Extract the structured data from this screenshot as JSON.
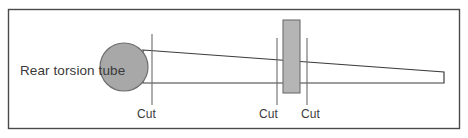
{
  "diagram": {
    "title_label": "Rear torsion tube",
    "frame": {
      "x": 8.5,
      "y": 9.5,
      "width": 451,
      "height": 119,
      "stroke": "#4a4a4a",
      "fill": "#ffffff",
      "stroke_width": 1.4
    },
    "torsion_tube": {
      "label": "Rear torsion tube",
      "shape": "circle",
      "cx": 124,
      "cy": 67,
      "r": 24,
      "fill": "#a8a8a8",
      "stroke": "#6e6e6e",
      "stroke_width": 1.2,
      "text_x": 20,
      "text_y": 75
    },
    "beam": {
      "description": "tapered beam outline",
      "points": "143,50 444,72 444,83 143,83",
      "fill": "#ffffff",
      "stroke": "#3d3d3d",
      "stroke_width": 1.2
    },
    "bracket": {
      "shape": "rectangle",
      "x": 283,
      "y": 20,
      "width": 17,
      "height": 73,
      "fill": "#b5b5b5",
      "stroke": "#6e6e6e",
      "stroke_width": 1.1
    },
    "cut_marks": [
      {
        "label": "Cut",
        "line_x": 152,
        "line_y1": 34,
        "line_y2": 105,
        "text_x": 137,
        "text_y": 118
      },
      {
        "label": "Cut",
        "line_x": 277,
        "line_y1": 38,
        "line_y2": 105,
        "text_x": 259,
        "text_y": 118
      },
      {
        "label": "Cut",
        "line_x": 307,
        "line_y1": 38,
        "line_y2": 105,
        "text_x": 301,
        "text_y": 118
      }
    ],
    "cut_line_stroke": "#6b6b6b",
    "cut_line_width": 1.1,
    "label_color": "#3a3a3a"
  }
}
